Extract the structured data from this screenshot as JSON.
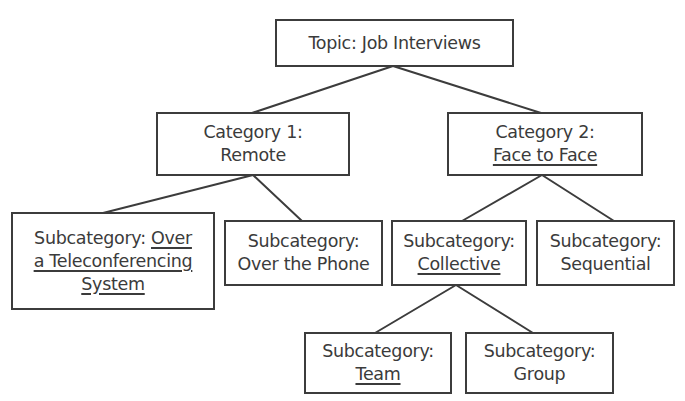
{
  "diagram": {
    "type": "tree",
    "colors": {
      "line": "#3c3c3c",
      "text": "#3b3b3b",
      "background": "#ffffff"
    },
    "root": {
      "id": "topic",
      "lines": [
        {
          "text": "Topic: Job Interviews",
          "underline": false
        }
      ]
    },
    "categories": [
      {
        "id": "category-1",
        "lines": [
          {
            "text": "Category 1:",
            "underline": false
          },
          {
            "text": "Remote",
            "underline": false
          }
        ]
      },
      {
        "id": "category-2",
        "label_prefix": "Category 2:",
        "label_underlined": "Face to Face"
      }
    ],
    "subcategories": {
      "teleconferencing": {
        "prefix": "Subcategory:",
        "underlined_1": "Over",
        "underlined_2": "a Teleconferencing",
        "underlined_3": "System"
      },
      "phone": {
        "line1": "Subcategory:",
        "line2": "Over the Phone"
      },
      "collective": {
        "line1": "Subcategory:",
        "line2": "Collective"
      },
      "sequential": {
        "line1": "Subcategory:",
        "line2": "Sequential"
      },
      "team": {
        "line1": "Subcategory:",
        "line2": "Team"
      },
      "group": {
        "line1": "Subcategory:",
        "line2": "Group"
      }
    },
    "root_label": "Topic: Job Interviews",
    "category_1_line1": "Category 1:",
    "category_1_line2": "Remote",
    "category_2_line1": "Category 2:",
    "category_2_line2": "Face to Face",
    "edges": [
      [
        "Topic: Job Interviews",
        "Category 1: Remote"
      ],
      [
        "Topic: Job Interviews",
        "Category 2: Face to Face"
      ],
      [
        "Category 1: Remote",
        "Subcategory: Over a Teleconferencing System"
      ],
      [
        "Category 1: Remote",
        "Subcategory: Over the Phone"
      ],
      [
        "Category 2: Face to Face",
        "Subcategory: Collective"
      ],
      [
        "Category 2: Face to Face",
        "Subcategory: Sequential"
      ],
      [
        "Subcategory: Collective",
        "Subcategory: Team"
      ],
      [
        "Subcategory: Collective",
        "Subcategory: Group"
      ]
    ]
  }
}
